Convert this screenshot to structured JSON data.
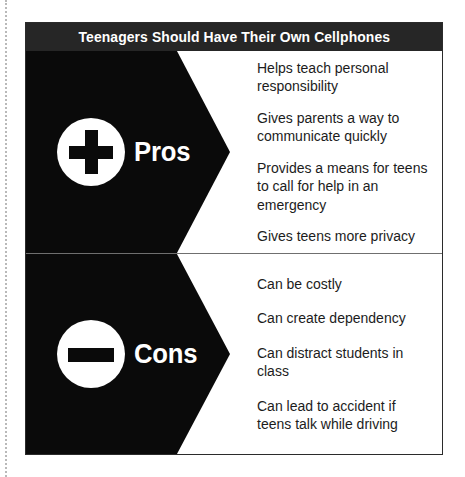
{
  "figure": {
    "title": "Teenagers Should Have Their Own Cellphones",
    "colors": {
      "banner": "#0a0a0a",
      "title_bar": "#262626",
      "background": "#ffffff",
      "border": "#2b2b2b",
      "divider": "#6f6f6f",
      "text": "#1c1c1c"
    },
    "sections": [
      {
        "key": "pros",
        "label": "Pros",
        "icon": "plus-icon",
        "items": [
          "Helps teach personal responsibility",
          "Gives parents a way to communicate quickly",
          "Provides a means for teens to call for help in an emergency",
          "Gives teens more privacy"
        ]
      },
      {
        "key": "cons",
        "label": "Cons",
        "icon": "minus-icon",
        "items": [
          "Can be costly",
          "Can create dependency",
          "Can distract students in class",
          "Can lead to accident if teens talk while driving"
        ]
      }
    ]
  }
}
